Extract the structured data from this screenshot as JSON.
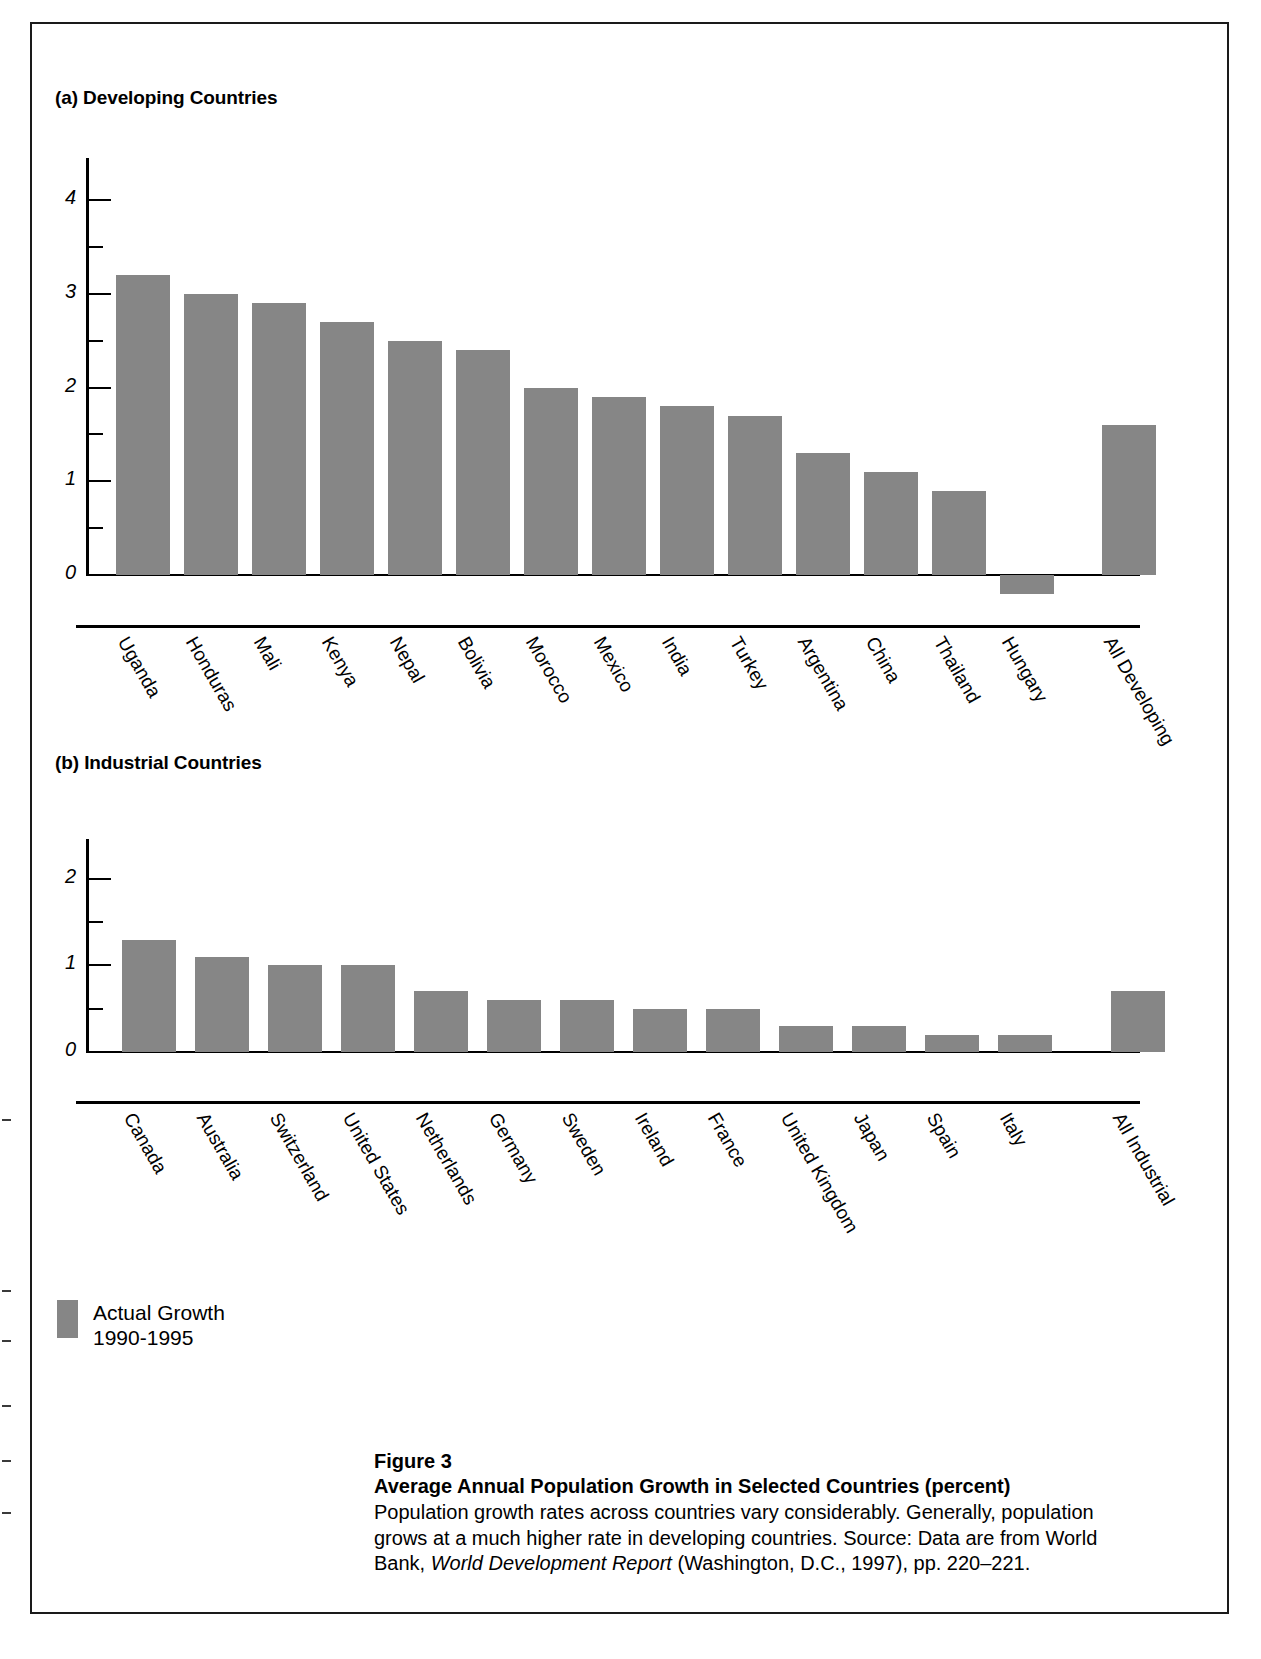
{
  "panel_a": {
    "title": "(a) Developing Countries"
  },
  "panel_b": {
    "title": "(b) Industrial Countries"
  },
  "legend": {
    "label_line1": "Actual Growth",
    "label_line2": "1990-1995",
    "swatch_color": "#868686"
  },
  "caption": {
    "figure_number": "Figure 3",
    "title": "Average Annual Population Growth in Selected Countries (percent)",
    "body_part1": "Population growth rates across countries vary considerably. Generally, population grows at a much higher rate in developing countries. Source: Data are from World Bank, ",
    "body_italic": "World Development Report",
    "body_part2": " (Washington, D.C., 1997), pp. 220–221."
  },
  "chart_data": [
    {
      "type": "bar",
      "title": "(a) Developing Countries",
      "xlabel": "",
      "ylabel": "",
      "ylim": [
        -0.4,
        4.3
      ],
      "yticks_major": [
        "0",
        "1",
        "2",
        "3",
        "4"
      ],
      "yticks_major_values": [
        0,
        1,
        2,
        3,
        4
      ],
      "yticks_minor_values": [
        0.5,
        1.5,
        2.5,
        3.5
      ],
      "grid": false,
      "legend": "Actual Growth 1990-1995",
      "series_name": "Actual Growth 1990-1995",
      "bar_color": "#868686",
      "categories": [
        "Uganda",
        "Honduras",
        "Mali",
        "Kenya",
        "Nepal",
        "Bolivia",
        "Morocco",
        "Mexico",
        "India",
        "Turkey",
        "Argentina",
        "China",
        "Thailand",
        "Hungary",
        "All Developing"
      ],
      "values": [
        3.2,
        3.0,
        2.9,
        2.7,
        2.5,
        2.4,
        2.0,
        1.9,
        1.8,
        1.7,
        1.3,
        1.1,
        0.9,
        -0.2,
        1.6
      ]
    },
    {
      "type": "bar",
      "title": "(b) Industrial Countries",
      "xlabel": "",
      "ylabel": "",
      "ylim": [
        -0.15,
        2.3
      ],
      "yticks_major": [
        "0",
        "1",
        "2"
      ],
      "yticks_major_values": [
        0,
        1,
        2
      ],
      "yticks_minor_values": [
        0.5,
        1.5
      ],
      "grid": false,
      "legend": "Actual Growth 1990-1995",
      "series_name": "Actual Growth 1990-1995",
      "bar_color": "#868686",
      "categories": [
        "Canada",
        "Australia",
        "Switzerland",
        "United States",
        "Netherlands",
        "Germany",
        "Sweden",
        "Ireland",
        "France",
        "United Kingdom",
        "Japan",
        "Spain",
        "Italy",
        "All Industrial"
      ],
      "values": [
        1.3,
        1.1,
        1.0,
        1.0,
        0.7,
        0.6,
        0.6,
        0.5,
        0.5,
        0.3,
        0.3,
        0.2,
        0.2,
        0.7
      ]
    }
  ]
}
